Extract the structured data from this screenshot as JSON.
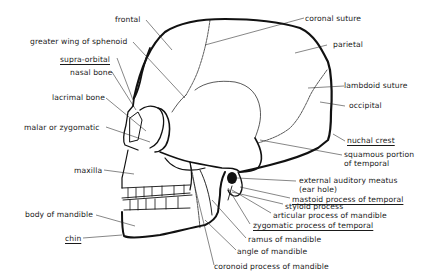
{
  "diagram": {
    "labels": {
      "frontal": "frontal",
      "greater_wing": "greater wing of sphenoid",
      "supra_orbital": "supra-orbital",
      "nasal_bone": "nasal bone",
      "lacrimal_bone": "lacrimal bone",
      "malar": "malar or zygomatic",
      "maxilla": "maxilla",
      "body_mandible": "body of mandible",
      "chin": "chin",
      "coronal_suture": "coronal suture",
      "parietal": "parietal",
      "lambdoid_suture": "lambdoid suture",
      "occipital": "occipital",
      "nuchal_crest": "nuchal crest",
      "squamous_1": "squamous portion",
      "squamous_2": "of temporal",
      "ext_meatus_1": "external auditory meatus",
      "ext_meatus_2": "(ear hole)",
      "mastoid": "mastoid process of temporal",
      "styloid": "styloid process",
      "articular": "articular process of mandible",
      "zygomatic_temporal": "zygomatic process of temporal",
      "ramus": "ramus of mandible",
      "angle": "angle of mandible",
      "coronoid": "coronoid process of mandible"
    },
    "underlined": [
      "supra-orbital",
      "chin",
      "nuchal crest",
      "mastoid process of temporal",
      "zygomatic process of temporal"
    ]
  }
}
